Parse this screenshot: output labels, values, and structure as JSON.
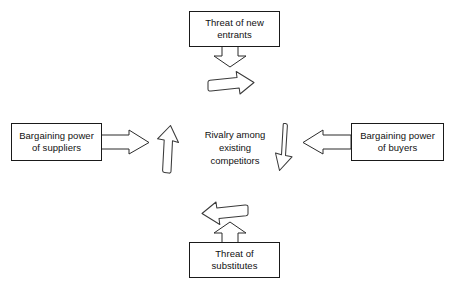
{
  "diagram": {
    "background_color": "#ffffff",
    "line_color": "#2b2b2b",
    "text_color": "#111111",
    "nodes": [
      {
        "id": "threat-of-new-entrants",
        "label": "Threat of new\nentrants",
        "position": "top",
        "boxed": true
      },
      {
        "id": "bargaining-power-of-suppliers",
        "label": "Bargaining power\nof suppliers",
        "position": "left",
        "boxed": true
      },
      {
        "id": "rivalry-among-existing-competitors",
        "label": "Rivalry among\nexisting\ncompetitors",
        "position": "center",
        "boxed": false
      },
      {
        "id": "bargaining-power-of-buyers",
        "label": "Bargaining power\nof buyers",
        "position": "right",
        "boxed": true
      },
      {
        "id": "threat-of-substitutes",
        "label": "Threat of\nsubstitutes",
        "position": "bottom",
        "boxed": true
      }
    ],
    "arrows": [
      {
        "id": "arrow-top-down",
        "style": "block",
        "direction": "down",
        "from": "threat-of-new-entrants",
        "to": "rivalry-among-existing-competitors"
      },
      {
        "id": "arrow-top-sketch",
        "style": "sketch",
        "direction": "right",
        "near": "threat-of-new-entrants"
      },
      {
        "id": "arrow-left-right",
        "style": "block",
        "direction": "right",
        "from": "bargaining-power-of-suppliers",
        "to": "rivalry-among-existing-competitors"
      },
      {
        "id": "arrow-left-sketch",
        "style": "sketch",
        "direction": "up",
        "near": "rivalry-among-existing-competitors"
      },
      {
        "id": "arrow-right-left",
        "style": "block",
        "direction": "left",
        "from": "bargaining-power-of-buyers",
        "to": "rivalry-among-existing-competitors"
      },
      {
        "id": "arrow-right-sketch",
        "style": "sketch",
        "direction": "down",
        "near": "rivalry-among-existing-competitors"
      },
      {
        "id": "arrow-bottom-up",
        "style": "block",
        "direction": "up",
        "from": "threat-of-substitutes",
        "to": "rivalry-among-existing-competitors"
      },
      {
        "id": "arrow-bottom-sketch",
        "style": "sketch",
        "direction": "left",
        "near": "threat-of-substitutes"
      }
    ]
  }
}
